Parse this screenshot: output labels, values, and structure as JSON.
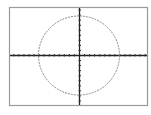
{
  "graph": {
    "window": {
      "xmin": -8,
      "xmax": 8,
      "ymin": -8,
      "ymax": 8
    },
    "equation": "x^2 + y^2 = 64",
    "colors": {
      "frame": "#9a9a9a",
      "axes": "#222222",
      "curve": "#8a8a8a",
      "background": "#ffffff"
    }
  },
  "chart_data": {
    "type": "line",
    "title": "",
    "xlabel": "",
    "ylabel": "",
    "shape": "circle",
    "center": [
      0,
      0
    ],
    "radius": 8,
    "xlim": [
      -8,
      8
    ],
    "ylim": [
      -8,
      8
    ],
    "grid": false,
    "tick_spacing": 1
  }
}
